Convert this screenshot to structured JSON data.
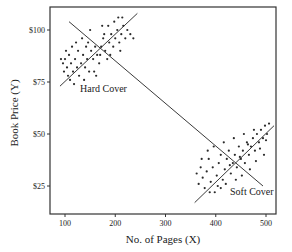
{
  "chart_data": {
    "type": "scatter",
    "title": "",
    "xlabel": "No. of Pages (X)",
    "ylabel": "Book Price (Y)",
    "xlim": [
      70,
      520
    ],
    "ylim": [
      14,
      112
    ],
    "x_ticks": [
      100,
      200,
      300,
      400,
      500
    ],
    "x_tick_labels": [
      "100",
      "200",
      "300",
      "400",
      "500"
    ],
    "y_ticks": [
      25,
      50,
      75,
      100
    ],
    "y_tick_labels": [
      "$25",
      "$50",
      "$75",
      "$100"
    ],
    "grid": false,
    "legend": null,
    "annotations": [
      {
        "text": "Hard Cover",
        "x": 130,
        "y": 71
      },
      {
        "text": "Soft Cover",
        "x": 430,
        "y": 23
      }
    ],
    "series": [
      {
        "name": "Hard Cover",
        "points": [
          [
            92,
            86
          ],
          [
            96,
            84
          ],
          [
            100,
            86
          ],
          [
            104,
            82
          ],
          [
            98,
            80
          ],
          [
            108,
            88
          ],
          [
            112,
            84
          ],
          [
            106,
            78
          ],
          [
            116,
            80
          ],
          [
            120,
            86
          ],
          [
            110,
            76
          ],
          [
            124,
            82
          ],
          [
            128,
            78
          ],
          [
            118,
            74
          ],
          [
            132,
            84
          ],
          [
            136,
            88
          ],
          [
            140,
            82
          ],
          [
            126,
            90
          ],
          [
            144,
            86
          ],
          [
            148,
            80
          ],
          [
            138,
            76
          ],
          [
            152,
            90
          ],
          [
            156,
            86
          ],
          [
            160,
            92
          ],
          [
            146,
            94
          ],
          [
            164,
            88
          ],
          [
            168,
            84
          ],
          [
            158,
            80
          ],
          [
            172,
            92
          ],
          [
            176,
            96
          ],
          [
            170,
            88
          ],
          [
            180,
            90
          ],
          [
            184,
            86
          ],
          [
            188,
            94
          ],
          [
            178,
            98
          ],
          [
            192,
            98
          ],
          [
            196,
            92
          ],
          [
            186,
            102
          ],
          [
            200,
            96
          ],
          [
            204,
            100
          ],
          [
            198,
            104
          ],
          [
            208,
            94
          ],
          [
            212,
            98
          ],
          [
            216,
            102
          ],
          [
            206,
            106
          ],
          [
            220,
            96
          ],
          [
            224,
            100
          ],
          [
            214,
            106
          ],
          [
            230,
            98
          ],
          [
            236,
            96
          ],
          [
            102,
            90
          ],
          [
            114,
            92
          ],
          [
            134,
            96
          ],
          [
            150,
            100
          ],
          [
            174,
            102
          ],
          [
            190,
            88
          ],
          [
            162,
            78
          ],
          [
            142,
            92
          ],
          [
            122,
            94
          ],
          [
            210,
            90
          ]
        ],
        "fit_line": {
          "x": [
            90,
            244
          ],
          "y": [
            73,
            108
          ]
        }
      },
      {
        "name": "Soft Cover",
        "points": [
          [
            362,
            31
          ],
          [
            366,
            26
          ],
          [
            370,
            34
          ],
          [
            374,
            29
          ],
          [
            378,
            24
          ],
          [
            382,
            32
          ],
          [
            386,
            38
          ],
          [
            390,
            27
          ],
          [
            394,
            34
          ],
          [
            398,
            22
          ],
          [
            402,
            30
          ],
          [
            406,
            36
          ],
          [
            410,
            40
          ],
          [
            414,
            28
          ],
          [
            418,
            33
          ],
          [
            422,
            38
          ],
          [
            426,
            42
          ],
          [
            430,
            31
          ],
          [
            434,
            36
          ],
          [
            438,
            40
          ],
          [
            442,
            34
          ],
          [
            446,
            44
          ],
          [
            450,
            38
          ],
          [
            454,
            42
          ],
          [
            458,
            36
          ],
          [
            462,
            46
          ],
          [
            466,
            40
          ],
          [
            470,
            44
          ],
          [
            474,
            48
          ],
          [
            478,
            42
          ],
          [
            482,
            50
          ],
          [
            486,
            46
          ],
          [
            490,
            52
          ],
          [
            494,
            48
          ],
          [
            498,
            54
          ],
          [
            502,
            50
          ],
          [
            506,
            55
          ],
          [
            410,
            24
          ],
          [
            420,
            26
          ],
          [
            440,
            28
          ],
          [
            452,
            30
          ],
          [
            468,
            33
          ],
          [
            480,
            37
          ],
          [
            496,
            40
          ],
          [
            384,
            42
          ],
          [
            396,
            44
          ],
          [
            416,
            46
          ],
          [
            436,
            48
          ],
          [
            456,
            50
          ],
          [
            476,
            52
          ],
          [
            372,
            38
          ],
          [
            388,
            22
          ],
          [
            404,
            25
          ],
          [
            428,
            35
          ],
          [
            448,
            39
          ],
          [
            464,
            45
          ],
          [
            488,
            43
          ],
          [
            500,
            47
          ]
        ],
        "fit_line": {
          "x": [
            358,
            516
          ],
          "y": [
            17,
            54
          ]
        }
      }
    ],
    "trend_line": {
      "x": [
        108,
        494
      ],
      "y": [
        104,
        25
      ]
    }
  },
  "plot": {
    "area_px": {
      "left": 50,
      "top": 7,
      "right": 276,
      "bottom": 214
    },
    "x_map": {
      "data": [
        100,
        500
      ],
      "px": [
        65,
        266
      ]
    },
    "y_map": {
      "data": [
        100,
        25
      ],
      "px": [
        30,
        186
      ]
    },
    "colors": {
      "axis": "#333333",
      "line": "#3a3a3a",
      "point": "#2a2a2a",
      "text": "#222222"
    }
  }
}
